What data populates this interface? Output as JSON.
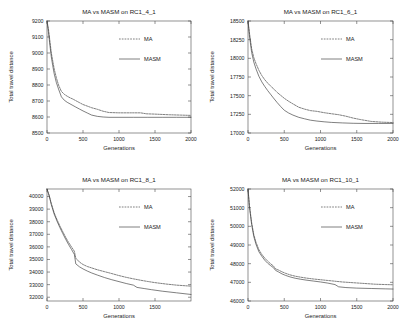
{
  "figure": {
    "panel_count": 4,
    "line_color": "#3a3a3a",
    "axis_color": "#4a4a4a"
  },
  "chart_data": [
    {
      "type": "line",
      "panel": "top-left",
      "title": "MA vs MASM on RC1_4_1",
      "xlabel": "Generations",
      "ylabel": "Total travel distance",
      "xlim": [
        0,
        2000
      ],
      "ylim": [
        8500,
        9200
      ],
      "xticks": [
        0,
        500,
        1000,
        1500,
        2000
      ],
      "xticklabels": [
        "0",
        "500",
        "1000",
        "1500",
        "2000"
      ],
      "yticks": [
        8500,
        8600,
        8700,
        8800,
        8900,
        9000,
        9100,
        9200
      ],
      "yticklabels": [
        "8500",
        "8600",
        "8700",
        "8800",
        "8900",
        "9000",
        "9100",
        "9200"
      ],
      "grid": false,
      "legend": {
        "position": "upper-right",
        "entries": [
          {
            "name": "MA",
            "style": "dashed"
          },
          {
            "name": "MASM",
            "style": "solid"
          }
        ]
      },
      "series": [
        {
          "name": "MA",
          "style": "dashed",
          "x": [
            0,
            20,
            40,
            60,
            80,
            100,
            130,
            160,
            200,
            240,
            280,
            320,
            360,
            400,
            450,
            500,
            560,
            620,
            700,
            780,
            860,
            1000,
            1150,
            1300,
            1380,
            1500,
            1700,
            1850,
            2000
          ],
          "y": [
            9200,
            9150,
            9075,
            9000,
            8950,
            8900,
            8845,
            8800,
            8760,
            8742,
            8730,
            8720,
            8712,
            8702,
            8690,
            8678,
            8668,
            8658,
            8648,
            8636,
            8628,
            8626,
            8626,
            8626,
            8620,
            8618,
            8614,
            8612,
            8610
          ]
        },
        {
          "name": "MASM",
          "style": "solid",
          "x": [
            0,
            20,
            40,
            60,
            80,
            100,
            130,
            160,
            200,
            240,
            280,
            320,
            360,
            400,
            450,
            500,
            560,
            620,
            700,
            780,
            860,
            1000,
            1200,
            1400,
            1600,
            1800,
            2000
          ],
          "y": [
            9200,
            9130,
            9050,
            8975,
            8920,
            8870,
            8815,
            8775,
            8726,
            8705,
            8692,
            8682,
            8672,
            8662,
            8650,
            8638,
            8625,
            8612,
            8604,
            8600,
            8598,
            8598,
            8598,
            8598,
            8598,
            8598,
            8598
          ]
        }
      ]
    },
    {
      "type": "line",
      "panel": "top-right",
      "title": "MA vs MASM on RC1_6_1",
      "xlabel": "Generations",
      "ylabel": "Total travel distance",
      "xlim": [
        0,
        2000
      ],
      "ylim": [
        17000,
        18500
      ],
      "xticks": [
        0,
        500,
        1000,
        1500,
        2000
      ],
      "xticklabels": [
        "0",
        "500",
        "1000",
        "1500",
        "2000"
      ],
      "yticks": [
        17000,
        17250,
        17500,
        17750,
        18000,
        18250,
        18500
      ],
      "yticklabels": [
        "17000",
        "17250",
        "17500",
        "17750",
        "18000",
        "18250",
        "18500"
      ],
      "grid": false,
      "legend": {
        "position": "upper-right",
        "entries": [
          {
            "name": "MA",
            "style": "dashed"
          },
          {
            "name": "MASM",
            "style": "solid"
          }
        ]
      },
      "series": [
        {
          "name": "MA",
          "style": "dashed",
          "x": [
            0,
            20,
            50,
            80,
            110,
            150,
            190,
            230,
            270,
            310,
            350,
            400,
            450,
            500,
            560,
            620,
            700,
            780,
            860,
            950,
            1050,
            1150,
            1250,
            1350,
            1450,
            1550,
            1700,
            1850,
            2000
          ],
          "y": [
            18500,
            18340,
            18130,
            18010,
            17930,
            17840,
            17770,
            17715,
            17670,
            17630,
            17595,
            17545,
            17505,
            17465,
            17425,
            17390,
            17345,
            17320,
            17300,
            17290,
            17272,
            17258,
            17245,
            17225,
            17200,
            17180,
            17155,
            17145,
            17140
          ]
        },
        {
          "name": "MASM",
          "style": "solid",
          "x": [
            0,
            20,
            50,
            80,
            110,
            150,
            190,
            230,
            270,
            310,
            350,
            400,
            450,
            500,
            560,
            620,
            700,
            780,
            860,
            950,
            1050,
            1150,
            1300,
            1450,
            1600,
            1800,
            2000
          ],
          "y": [
            18500,
            18300,
            18080,
            17950,
            17860,
            17760,
            17685,
            17625,
            17570,
            17520,
            17470,
            17410,
            17355,
            17305,
            17268,
            17240,
            17210,
            17190,
            17172,
            17160,
            17150,
            17142,
            17135,
            17130,
            17128,
            17128,
            17128
          ]
        }
      ]
    },
    {
      "type": "line",
      "panel": "bottom-left",
      "title": "MA vs MASM on RC1_8_1",
      "xlabel": "Generations",
      "ylabel": "Total travel distance",
      "xlim": [
        0,
        2000
      ],
      "ylim": [
        31700,
        40600
      ],
      "xticks": [
        0,
        500,
        1000,
        1500
      ],
      "xticklabels": [
        "0",
        "500",
        "1000",
        "1500"
      ],
      "yticks": [
        32000,
        33000,
        34000,
        35000,
        36000,
        37000,
        38000,
        39000,
        40000
      ],
      "yticklabels": [
        "32000",
        "33000",
        "34000",
        "35000",
        "36000",
        "37000",
        "38000",
        "39000",
        "40000"
      ],
      "grid": false,
      "legend": {
        "position": "upper-right",
        "entries": [
          {
            "name": "MA",
            "style": "dashed"
          },
          {
            "name": "MASM",
            "style": "solid"
          }
        ]
      },
      "series": [
        {
          "name": "MA",
          "style": "dashed",
          "x": [
            0,
            30,
            60,
            100,
            140,
            180,
            220,
            260,
            300,
            340,
            380,
            400,
            450,
            500,
            560,
            620,
            700,
            800,
            900,
            1000,
            1100,
            1200,
            1300,
            1400,
            1500,
            1650,
            1800,
            2000
          ],
          "y": [
            40600,
            40100,
            39450,
            38700,
            38150,
            37650,
            37200,
            36750,
            36350,
            36000,
            35650,
            35100,
            34800,
            34600,
            34440,
            34330,
            34180,
            34030,
            33880,
            33720,
            33580,
            33460,
            33350,
            33250,
            33160,
            33050,
            32960,
            32880
          ]
        },
        {
          "name": "MASM",
          "style": "solid",
          "x": [
            0,
            30,
            60,
            100,
            140,
            180,
            220,
            260,
            300,
            340,
            380,
            400,
            450,
            500,
            560,
            620,
            700,
            800,
            900,
            1000,
            1100,
            1200,
            1250,
            1350,
            1450,
            1600,
            1800,
            2000
          ],
          "y": [
            40600,
            40050,
            39350,
            38600,
            38030,
            37520,
            37050,
            36600,
            36180,
            35800,
            35400,
            34650,
            34420,
            34250,
            34080,
            33930,
            33760,
            33560,
            33390,
            33240,
            33090,
            32960,
            32780,
            32690,
            32600,
            32480,
            32350,
            32220
          ]
        }
      ]
    },
    {
      "type": "line",
      "panel": "bottom-right",
      "title": "MA vs MASM on RC1_10_1",
      "xlabel": "Generations",
      "ylabel": "Total travel distance",
      "xlim": [
        0,
        2000
      ],
      "ylim": [
        46000,
        52000
      ],
      "xticks": [
        0,
        500,
        1000,
        1500,
        2000
      ],
      "xticklabels": [
        "0",
        "500",
        "1000",
        "1500",
        "2000"
      ],
      "yticks": [
        46000,
        47000,
        48000,
        49000,
        50000,
        51000,
        52000
      ],
      "yticklabels": [
        "46000",
        "47000",
        "48000",
        "49000",
        "50000",
        "51000",
        "52000"
      ],
      "grid": false,
      "legend": {
        "position": "upper-right",
        "entries": [
          {
            "name": "MA",
            "style": "dashed"
          },
          {
            "name": "MASM",
            "style": "solid"
          }
        ]
      },
      "series": [
        {
          "name": "MA",
          "style": "dashed",
          "x": [
            0,
            20,
            50,
            80,
            110,
            150,
            190,
            230,
            270,
            310,
            350,
            380,
            420,
            470,
            520,
            580,
            650,
            720,
            800,
            900,
            1000,
            1100,
            1200,
            1300,
            1450,
            1600,
            1750,
            1900,
            2000
          ],
          "y": [
            52000,
            51100,
            50200,
            49550,
            49150,
            48750,
            48500,
            48300,
            48140,
            48000,
            47880,
            47720,
            47660,
            47560,
            47480,
            47400,
            47330,
            47280,
            47230,
            47180,
            47140,
            47100,
            47060,
            47020,
            46980,
            46940,
            46900,
            46880,
            46870
          ]
        },
        {
          "name": "MASM",
          "style": "solid",
          "x": [
            0,
            20,
            50,
            80,
            110,
            150,
            190,
            230,
            270,
            310,
            350,
            380,
            420,
            470,
            520,
            580,
            650,
            720,
            800,
            900,
            1000,
            1100,
            1200,
            1250,
            1350,
            1500,
            1700,
            1900,
            2000
          ],
          "y": [
            52000,
            51050,
            50100,
            49450,
            49040,
            48640,
            48400,
            48190,
            48030,
            47900,
            47790,
            47640,
            47560,
            47450,
            47370,
            47290,
            47220,
            47170,
            47120,
            47070,
            47020,
            46960,
            46880,
            46760,
            46720,
            46690,
            46670,
            46650,
            46640
          ]
        }
      ]
    }
  ]
}
